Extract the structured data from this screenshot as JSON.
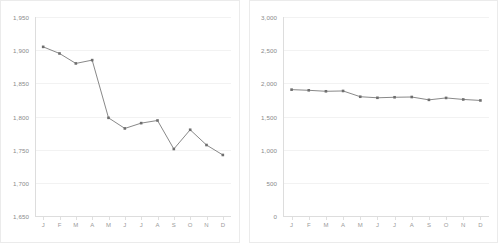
{
  "page": {
    "background_color": "#ffffff",
    "panel_border_color": "#ebebeb",
    "gridline_color": "#f2f2f2",
    "axis_color": "#dddddd",
    "tick_label_color": "#8a8a8a",
    "series_color": "#7a7a7a",
    "marker_color": "#6e6e6e"
  },
  "chart_data": [
    {
      "type": "line",
      "panel": "left",
      "title": "",
      "subtitle": "",
      "xlabel": "",
      "ylabel": "",
      "grid": true,
      "legend": "none",
      "categories": [
        "J",
        "F",
        "M",
        "A",
        "M",
        "J",
        "J",
        "A",
        "S",
        "O",
        "N",
        "D"
      ],
      "yticks": [
        "1,650",
        "1,700",
        "1,750",
        "1,800",
        "1,850",
        "1,900",
        "1,950"
      ],
      "ytick_values": [
        1650,
        1700,
        1750,
        1800,
        1850,
        1900,
        1950
      ],
      "ylim": [
        1650,
        1950
      ],
      "series": [
        {
          "name": "Series 1",
          "values": [
            1905,
            1895,
            1880,
            1885,
            1798,
            1782,
            1790,
            1794,
            1751,
            1780,
            1757,
            1742
          ]
        }
      ]
    },
    {
      "type": "line",
      "panel": "right",
      "title": "",
      "subtitle": "",
      "xlabel": "",
      "ylabel": "",
      "grid": true,
      "legend": "none",
      "categories": [
        "J",
        "F",
        "M",
        "A",
        "M",
        "J",
        "J",
        "A",
        "S",
        "O",
        "N",
        "D"
      ],
      "yticks": [
        "0",
        "500",
        "1,000",
        "1,500",
        "2,000",
        "2,500",
        "3,000"
      ],
      "ytick_values": [
        0,
        500,
        1000,
        1500,
        2000,
        2500,
        3000
      ],
      "ylim": [
        0,
        3000
      ],
      "series": [
        {
          "name": "Series 1",
          "values": [
            1905,
            1895,
            1880,
            1885,
            1798,
            1782,
            1790,
            1794,
            1751,
            1780,
            1757,
            1742
          ]
        }
      ]
    }
  ]
}
